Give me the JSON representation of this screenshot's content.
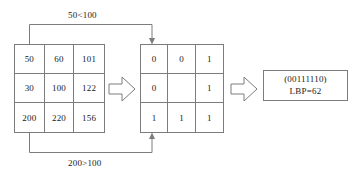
{
  "diagram": {
    "colors": {
      "line": "#7c7c7c",
      "text": "#1a1a1a",
      "background": "#ffffff"
    },
    "pixel_grid": {
      "name": "pixel-intensity-grid",
      "cells": [
        "50",
        "60",
        "101",
        "30",
        "100",
        "122",
        "200",
        "220",
        "156"
      ]
    },
    "binary_grid": {
      "name": "thresholded-binary-grid",
      "cells": [
        "0",
        "0",
        "1",
        "0",
        "",
        "1",
        "1",
        "1",
        "1"
      ]
    },
    "result": {
      "binary_string": "(00111110)",
      "lbp_value": "LBP=62"
    },
    "annotations": {
      "top_comparison": "50<100",
      "bottom_comparison": "200>100"
    },
    "arrows": {
      "pixel_to_binary": "block-arrow-right",
      "binary_to_result": "block-arrow-right",
      "top_connector": "elbow-arrow-down",
      "bottom_connector": "elbow-arrow-up"
    }
  }
}
